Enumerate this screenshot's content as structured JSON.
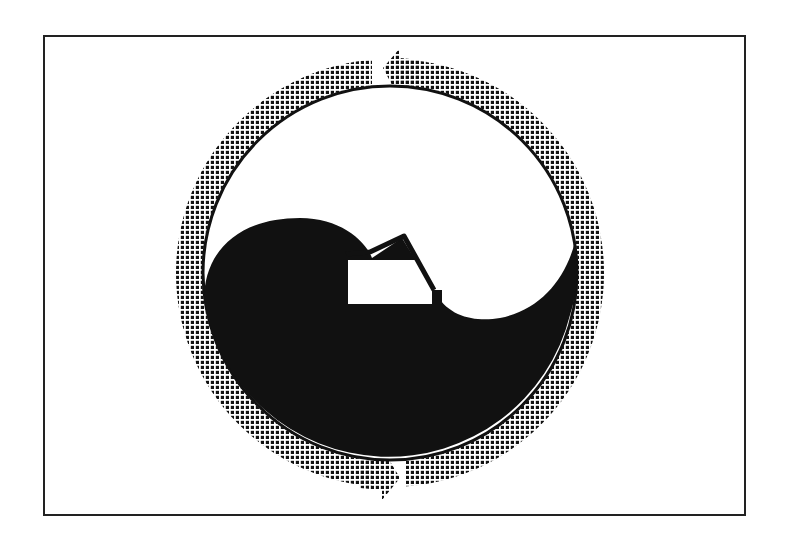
{
  "diagram": {
    "type": "cycle-symbol",
    "colors": {
      "ink": "#111111",
      "paper": "#ffffff",
      "frame": "#222222"
    },
    "ring": {
      "center": [
        390,
        273
      ],
      "outer_radius": 214,
      "inner_radius": 188,
      "pattern": "dot-halftone",
      "arrows": [
        {
          "name": "top-arrow",
          "direction": "counterclockwise",
          "tip": [
            383,
            60
          ]
        },
        {
          "name": "bottom-arrow",
          "direction": "clockwise",
          "tip": [
            377,
            492
          ]
        }
      ]
    },
    "elements": [
      "outer-frame",
      "dotted-ring-arrows",
      "inner-circle",
      "black-lower-region",
      "white-rectangle",
      "house-roof-line"
    ]
  }
}
